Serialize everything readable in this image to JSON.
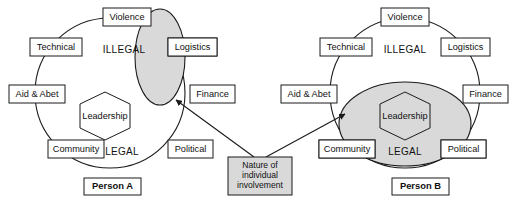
{
  "diagram": {
    "colors": {
      "shade": "#d9d9d9",
      "stroke": "#1a1a1a",
      "box_fill": "#ffffff",
      "background": "#ffffff"
    },
    "zone_labels": {
      "illegal": "ILLEGAL",
      "legal": "LEGAL"
    },
    "core_label": "Leadership",
    "ring_nodes": [
      {
        "id": "violence",
        "label": "Violence"
      },
      {
        "id": "logistics",
        "label": "Logistics"
      },
      {
        "id": "finance",
        "label": "Finance"
      },
      {
        "id": "political",
        "label": "Political"
      },
      {
        "id": "community",
        "label": "Community"
      },
      {
        "id": "aid-abet",
        "label": "Aid & Abet"
      },
      {
        "id": "technical",
        "label": "Technical"
      }
    ],
    "callout": {
      "lines": [
        "Nature of",
        "individual",
        "involvement"
      ]
    },
    "persons": [
      {
        "id": "person-a",
        "label": "Person A",
        "involvement_shape": "vertical-ellipse",
        "core_shaded": false
      },
      {
        "id": "person-b",
        "label": "Person B",
        "involvement_shape": "horizontal-ellipse",
        "core_shaded": true
      }
    ]
  }
}
